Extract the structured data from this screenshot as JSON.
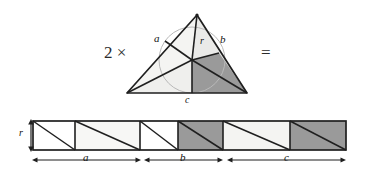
{
  "figure": {
    "operators": {
      "multiplier": "2 ×",
      "equals": "="
    },
    "colors": {
      "ink": "#1a1a1a",
      "paper": "#ffffff",
      "shade_dark": "#9a9a9a",
      "shade_light": "#f2f2f0",
      "shade_mid": "#e8e8e6",
      "circle": "#b5b5b5"
    },
    "triangle": {
      "labels": {
        "a": "a",
        "b": "b",
        "c": "c",
        "r": "r"
      },
      "vertices": {
        "apex": [
          197,
          15
        ],
        "left": [
          127,
          93
        ],
        "right": [
          247,
          93
        ]
      },
      "incenter": [
        192,
        60
      ],
      "inradius": 33,
      "label_positions": {
        "a": [
          156,
          37
        ],
        "b": [
          221,
          39
        ],
        "r": [
          201,
          39
        ],
        "c": [
          186,
          96
        ]
      }
    },
    "strip": {
      "labels": {
        "r": "r",
        "a": "a",
        "b": "b",
        "c": "c"
      },
      "height_label": "r",
      "segment_labels": [
        "a",
        "b",
        "c"
      ],
      "cell_count": 6,
      "cells": [
        {
          "index": 1,
          "fill": "white",
          "segment": "a"
        },
        {
          "index": 2,
          "fill": "light",
          "segment": "a"
        },
        {
          "index": 3,
          "fill": "white",
          "segment": "b"
        },
        {
          "index": 4,
          "fill": "dark",
          "segment": "b"
        },
        {
          "index": 5,
          "fill": "light",
          "segment": "c"
        },
        {
          "index": 6,
          "fill": "dark",
          "segment": "c"
        }
      ],
      "x_bounds": [
        33,
        75,
        140,
        178,
        223,
        290,
        346
      ],
      "y_top": 121,
      "y_bottom": 150,
      "segment_spans": [
        [
          33,
          140
        ],
        [
          145,
          223
        ],
        [
          228,
          346
        ]
      ]
    }
  }
}
